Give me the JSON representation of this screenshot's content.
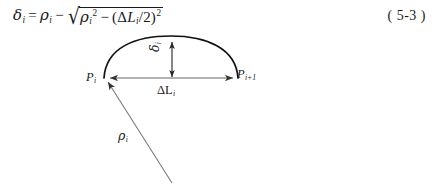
{
  "document": {
    "type": "textbook-figure",
    "equation_number": "( 5-3 )"
  },
  "equation": {
    "lhs_symbol": "δ",
    "lhs_sub": "i",
    "equals": "=",
    "term1_symbol": "ρ",
    "term1_sub": "i",
    "minus": "−",
    "radical_sign": "√",
    "rad_term1_symbol": "ρ",
    "rad_term1_sub": "i",
    "rad_term1_sup": "2",
    "rad_minus": "−",
    "rad_open_paren": "(",
    "rad_delta": "Δ",
    "rad_L": "L",
    "rad_L_sub": "i",
    "rad_divide": "/",
    "rad_two": "2",
    "rad_close_paren": ")",
    "rad_sup": "2",
    "plain_text": "δi = ρi − √(ρi² − (ΔLi/2)²)"
  },
  "diagram": {
    "labels": {
      "point_left": {
        "base": "P",
        "sub": "i"
      },
      "point_right": {
        "base": "P",
        "sub": "i+1"
      },
      "chord": {
        "base": "ΔL",
        "sub": "i"
      },
      "sagitta": {
        "base": "δ",
        "sub": "i"
      },
      "radius": {
        "base": "ρ",
        "sub": "i"
      }
    },
    "geometry": {
      "arc_start": [
        104,
        78
      ],
      "arc_end": [
        238,
        78
      ],
      "arc_apex": [
        172,
        45
      ],
      "chord_y": 78,
      "sagitta_x": 172,
      "sagitta_top": 46,
      "sagitta_bottom": 77,
      "radius_line_end": [
        172,
        183
      ]
    },
    "colors": {
      "arc_stroke": "#111111",
      "chord_stroke": "#555555",
      "radius_stroke": "#777777",
      "text": "#1a1a1a",
      "background": "#ffffff"
    }
  }
}
